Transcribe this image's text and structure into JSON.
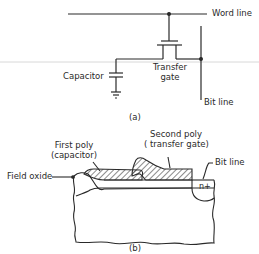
{
  "figure_a": {
    "caption": "(a)",
    "labels": {
      "word_line": "Word line",
      "bit_line": "Bit line",
      "capacitor": "Capacitor",
      "transfer_gate_line1": "Transfer",
      "transfer_gate_line2": "gate"
    }
  },
  "figure_b": {
    "caption": "(b)",
    "labels": {
      "first_poly_line1": "First poly",
      "first_poly_line2": "(capacitor)",
      "second_poly_line1": "Second poly",
      "second_poly_line2": "( transfer gate)",
      "bit_line": "Bit line",
      "field_oxide": "Field oxide",
      "n_plus": "n+"
    }
  },
  "colors": {
    "ink": "#2a2a2a",
    "background": "#ffffff",
    "scan_line": "#d8d8d8"
  }
}
